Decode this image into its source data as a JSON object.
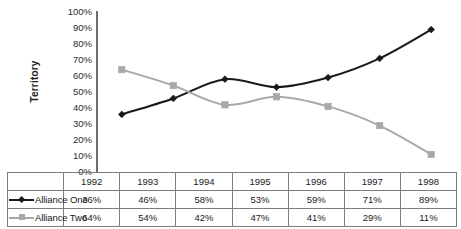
{
  "chart_data": {
    "type": "line",
    "title": "",
    "xlabel": "",
    "ylabel": "Territory",
    "categories": [
      "1992",
      "1993",
      "1994",
      "1995",
      "1996",
      "1997",
      "1998"
    ],
    "ylim": [
      0,
      100
    ],
    "ytick_labels": [
      "100%",
      "90%",
      "80%",
      "70%",
      "60%",
      "50%",
      "40%",
      "30%",
      "20%",
      "10%",
      "0%"
    ],
    "ytick_values": [
      100,
      90,
      80,
      70,
      60,
      50,
      40,
      30,
      20,
      10,
      0
    ],
    "grid": false,
    "legend_position": "data-table-left",
    "smoothed_lines": true,
    "series": [
      {
        "name": "Alliance One",
        "values": [
          36,
          46,
          58,
          53,
          59,
          71,
          89
        ],
        "labels": [
          "36%",
          "46%",
          "58%",
          "53%",
          "59%",
          "71%",
          "89%"
        ],
        "color": "#1a1a1a",
        "marker": "diamond"
      },
      {
        "name": "Alliance Two",
        "values": [
          64,
          54,
          42,
          47,
          41,
          29,
          11
        ],
        "labels": [
          "64%",
          "54%",
          "42%",
          "47%",
          "41%",
          "29%",
          "11%"
        ],
        "color": "#a8a8a8",
        "marker": "square"
      }
    ]
  },
  "axis": {
    "axis_line_color": "#6e6e6e"
  },
  "table": {
    "border_color": "#7d7d7d"
  }
}
